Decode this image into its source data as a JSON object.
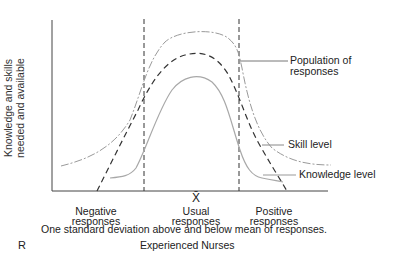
{
  "figure": {
    "y_axis_label_line1": "Knowledge and skills",
    "y_axis_label_line2": "needed and available",
    "mean_symbol": "X̄",
    "categories": [
      {
        "line1": "Negative",
        "line2": "responses"
      },
      {
        "line1": "Usual",
        "line2": "responses"
      },
      {
        "line1": "Positive",
        "line2": "responses"
      }
    ],
    "caption": "One standard deviation above and below mean of responses.",
    "panel_letter": "R",
    "subtitle": "Experienced Nurses",
    "legend": {
      "population": {
        "line1": "Population of",
        "line2": "responses",
        "style": "dash-dot",
        "color": "#9a9a9a"
      },
      "skill": {
        "label": "Skill level",
        "style": "dashed",
        "color": "#333333"
      },
      "knowledge": {
        "label": "Knowledge level",
        "style": "solid",
        "color": "#a8a8a8"
      }
    }
  }
}
